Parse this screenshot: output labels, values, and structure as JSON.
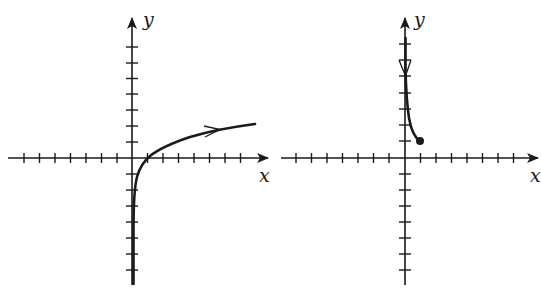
{
  "figure": {
    "colors": {
      "ink": "#1a1a1a",
      "background": "#ffffff"
    },
    "graphs": [
      {
        "id": "left",
        "x_label": "x",
        "y_label": "y",
        "origin": [
          132,
          158
        ],
        "tick_spacing": 15.5,
        "x_ticks_left": 7,
        "x_ticks_right": 7,
        "y_ticks_up": 7,
        "y_ticks_down": 7,
        "curve_description": "Increasing curve from bottom near y-axis (vertical asymptote at x=0), crossing x-axis at x=1, rising slowly to the right, arrow pointing right",
        "curve_direction": "right",
        "endpoint": null
      },
      {
        "id": "right",
        "x_label": "x",
        "y_label": "y",
        "origin": [
          405,
          158
        ],
        "tick_spacing": 15.5,
        "x_ticks_left": 7,
        "x_ticks_right": 7,
        "y_ticks_up": 7,
        "y_ticks_down": 7,
        "curve_description": "Curve starting near top of y-axis, descending and curving right to a closed endpoint at (1, 1), arrow pointing down",
        "curve_direction": "down",
        "endpoint": {
          "x": 1,
          "y": 1,
          "style": "filled-dot"
        }
      }
    ]
  }
}
